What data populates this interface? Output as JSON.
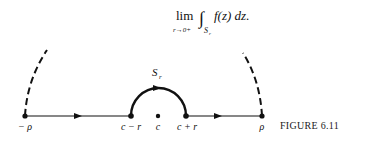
{
  "formula": {
    "lim": "lim",
    "lim_sub": "r→0+",
    "integral": "∫",
    "integral_sub": "S",
    "integral_sub_index": "r",
    "integrand": "f(z) dz."
  },
  "figure": {
    "caption": "FIGURE 6.11",
    "semicircle_label": "S",
    "semicircle_label_index": "r",
    "points": [
      {
        "label": "− ρ",
        "x": 25
      },
      {
        "label": "c − r",
        "x": 131
      },
      {
        "label": "c",
        "x": 158
      },
      {
        "label": "c + r",
        "x": 186
      },
      {
        "label": "ρ",
        "x": 262
      }
    ],
    "axis_y": 116,
    "colors": {
      "ink": "#111111",
      "background": "#ffffff"
    }
  }
}
